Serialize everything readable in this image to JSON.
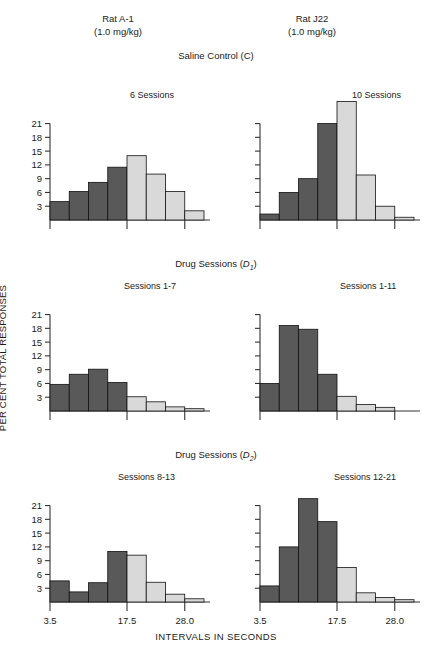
{
  "columns": [
    {
      "name": "Rat A-1",
      "dose": "(1.0 mg/kg)"
    },
    {
      "name": "Rat J22",
      "dose": "(1.0 mg/kg)"
    }
  ],
  "sections": [
    {
      "id": "saline",
      "label_main": "Saline Control (C)",
      "label_prefix": "Saline Control (C)",
      "sub": ""
    },
    {
      "id": "d1",
      "label_prefix": "Drug Sessions (",
      "sub": "1",
      "suffix": ")"
    },
    {
      "id": "d2",
      "label_prefix": "Drug Sessions (",
      "sub": "2",
      "suffix": ")"
    }
  ],
  "axes": {
    "ylabel": "PER CENT  TOTAL  RESPONSES",
    "xlabel": "INTERVALS IN SECONDS",
    "yticks": [
      3,
      6,
      9,
      12,
      15,
      18,
      21
    ],
    "ytick_labels": [
      "3",
      "6",
      "9",
      "12",
      "15",
      "18",
      "21"
    ],
    "xtick_labels": [
      "3.5",
      "17.5",
      "28.0"
    ],
    "ymax": 27
  },
  "colors": {
    "bar_dark": "#595959",
    "bar_light": "#d9d9d9",
    "bar_stroke": "#111111",
    "axis": "#333333",
    "text": "#1a1a1a",
    "background": "#ffffff"
  },
  "chart_data": {
    "type": "bar",
    "xlabel": "INTERVALS IN SECONDS",
    "ylabel": "PER CENT TOTAL RESPONSES",
    "ylim": [
      0,
      27
    ],
    "grid": false,
    "legend": "none",
    "bin_count": 8,
    "xtick_labels": [
      "3.5",
      "17.5",
      "28.0"
    ],
    "xtick_bins": [
      0,
      4,
      7
    ],
    "note": "First four bins are shaded dark, last four bins are shaded light.",
    "panels": [
      {
        "id": "saline-a1",
        "row": "Saline Control (C)",
        "subject": "Rat A-1",
        "sessions_label": "6 Sessions",
        "show_yticks": true,
        "values": [
          4.0,
          6.2,
          8.2,
          11.5,
          14.0,
          10.0,
          6.2,
          2.0
        ],
        "shades": [
          "dark",
          "dark",
          "dark",
          "dark",
          "light",
          "light",
          "light",
          "light"
        ]
      },
      {
        "id": "saline-j22",
        "row": "Saline Control (C)",
        "subject": "Rat J22",
        "sessions_label": "10 Sessions",
        "show_yticks": false,
        "values": [
          1.3,
          6.0,
          9.0,
          21.0,
          25.8,
          9.8,
          3.0,
          0.6
        ],
        "shades": [
          "dark",
          "dark",
          "dark",
          "dark",
          "light",
          "light",
          "light",
          "light"
        ]
      },
      {
        "id": "d1-a1",
        "row": "Drug Sessions (D1)",
        "subject": "Rat A-1",
        "sessions_label": "Sessions 1-7",
        "show_yticks": true,
        "values": [
          5.8,
          8.0,
          9.1,
          6.2,
          3.1,
          2.0,
          0.9,
          0.5
        ],
        "shades": [
          "dark",
          "dark",
          "dark",
          "dark",
          "light",
          "light",
          "light",
          "light"
        ]
      },
      {
        "id": "d1-j22",
        "row": "Drug Sessions (D1)",
        "subject": "Rat J22",
        "sessions_label": "Sessions 1-11",
        "show_yticks": false,
        "values": [
          6.0,
          18.6,
          17.8,
          8.0,
          3.2,
          1.4,
          0.8,
          0.0
        ],
        "shades": [
          "dark",
          "dark",
          "dark",
          "dark",
          "light",
          "light",
          "light",
          "light"
        ]
      },
      {
        "id": "d2-a1",
        "row": "Drug Sessions (D2)",
        "subject": "Rat A-1",
        "sessions_label": "Sessions 8-13",
        "show_yticks": true,
        "values": [
          4.6,
          2.2,
          4.2,
          11.0,
          10.2,
          4.3,
          1.7,
          0.7
        ],
        "shades": [
          "dark",
          "dark",
          "dark",
          "dark",
          "light",
          "light",
          "light",
          "light"
        ]
      },
      {
        "id": "d2-j22",
        "row": "Drug Sessions (D2)",
        "subject": "Rat J22",
        "sessions_label": "Sessions 12-21",
        "show_yticks": false,
        "values": [
          3.5,
          12.0,
          22.5,
          17.5,
          7.5,
          2.0,
          1.0,
          0.5
        ],
        "shades": [
          "dark",
          "dark",
          "dark",
          "dark",
          "light",
          "light",
          "light",
          "light"
        ]
      }
    ]
  }
}
